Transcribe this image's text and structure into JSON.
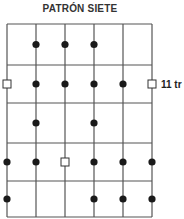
{
  "title": "PATRÓN SIETE",
  "fret_label": "11 tr",
  "colors": {
    "line": "#555555",
    "dot": "#1a1a1a",
    "root": "#ffffff"
  },
  "grid": {
    "strings_x": [
      7,
      36,
      65,
      94,
      123,
      152
    ],
    "frets_y": [
      24,
      65,
      103,
      143,
      181,
      217
    ]
  },
  "notes": [
    {
      "fret": 1,
      "string": 2,
      "type": "dot"
    },
    {
      "fret": 1,
      "string": 3,
      "type": "dot"
    },
    {
      "fret": 1,
      "string": 4,
      "type": "dot"
    },
    {
      "fret": 2,
      "string": 1,
      "type": "root"
    },
    {
      "fret": 2,
      "string": 2,
      "type": "dot"
    },
    {
      "fret": 2,
      "string": 3,
      "type": "dot"
    },
    {
      "fret": 2,
      "string": 4,
      "type": "dot"
    },
    {
      "fret": 2,
      "string": 5,
      "type": "dot"
    },
    {
      "fret": 2,
      "string": 6,
      "type": "root"
    },
    {
      "fret": 3,
      "string": 2,
      "type": "dot"
    },
    {
      "fret": 3,
      "string": 4,
      "type": "dot"
    },
    {
      "fret": 4,
      "string": 1,
      "type": "dot"
    },
    {
      "fret": 4,
      "string": 2,
      "type": "dot"
    },
    {
      "fret": 4,
      "string": 3,
      "type": "root"
    },
    {
      "fret": 4,
      "string": 4,
      "type": "dot"
    },
    {
      "fret": 4,
      "string": 5,
      "type": "dot"
    },
    {
      "fret": 4,
      "string": 6,
      "type": "dot"
    },
    {
      "fret": 5,
      "string": 1,
      "type": "dot"
    },
    {
      "fret": 5,
      "string": 4,
      "type": "dot"
    },
    {
      "fret": 5,
      "string": 5,
      "type": "dot"
    },
    {
      "fret": 5,
      "string": 6,
      "type": "dot"
    }
  ]
}
